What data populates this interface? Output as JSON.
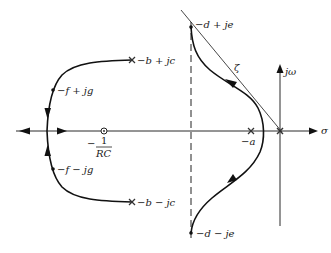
{
  "diagram": {
    "type": "root-locus",
    "axes": {
      "real_label": "σ",
      "imag_label": "jω"
    },
    "poles": [
      {
        "label": "−b + jc"
      },
      {
        "label": "−b − jc"
      },
      {
        "label": "−a"
      },
      {
        "label": "origin"
      }
    ],
    "zeros": [
      {
        "label_numerator": "1",
        "label_denominator": "RC",
        "label_sign": "−"
      }
    ],
    "points": [
      {
        "label": "−f + jg"
      },
      {
        "label": "−f − jg"
      },
      {
        "label": "−d + je"
      },
      {
        "label": "−d − je"
      }
    ],
    "damping_line_label": "ζ"
  }
}
